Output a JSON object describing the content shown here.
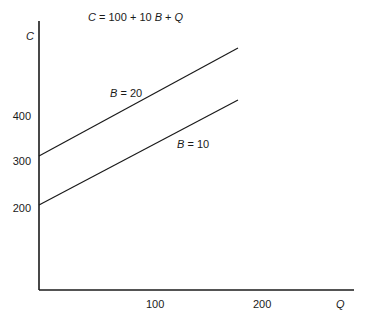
{
  "chart_data": {
    "type": "line",
    "title": "C = 100 + 10 B + Q",
    "xlabel": "Q",
    "ylabel": "C",
    "x_ticks": [
      "100",
      "200"
    ],
    "y_ticks": [
      "200",
      "300",
      "400"
    ],
    "xlim": [
      0,
      290
    ],
    "ylim": [
      0,
      560
    ],
    "grid": false,
    "legend": "none (inline line labels)",
    "series": [
      {
        "name": "B = 20",
        "x": [
          0,
          175
        ],
        "values": [
          300,
          475
        ]
      },
      {
        "name": "B = 10",
        "x": [
          0,
          175
        ],
        "values": [
          200,
          375
        ]
      }
    ]
  },
  "labels": {
    "equation": "C = 100 + 10 B + Q",
    "y_axis": "C",
    "x_axis": "Q",
    "line_b20": "B = 20",
    "line_b10": "B = 10",
    "y_tick_400": "400",
    "y_tick_300": "300",
    "y_tick_200": "200",
    "x_tick_100": "100",
    "x_tick_200": "200"
  },
  "colors": {
    "ink": "#1a1a1a",
    "background": "#ffffff"
  }
}
